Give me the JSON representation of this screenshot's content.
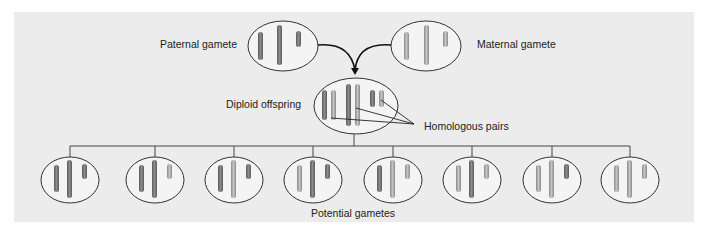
{
  "labels": {
    "paternal": "Paternal gamete",
    "maternal": "Maternal gamete",
    "diploid": "Diploid offspring",
    "homologous": "Homologous pairs",
    "potential": "Potential gametes"
  },
  "colors": {
    "panel": "#ececec",
    "oval_fill": "#f4f4f4",
    "outline": "#333333",
    "paternal_chromosome": "#7a7a7a",
    "maternal_chromosome": "#a6a6a6"
  },
  "gametes": {
    "count": 8,
    "centers_x": [
      70,
      155,
      234,
      313,
      393,
      472,
      552,
      630
    ]
  }
}
